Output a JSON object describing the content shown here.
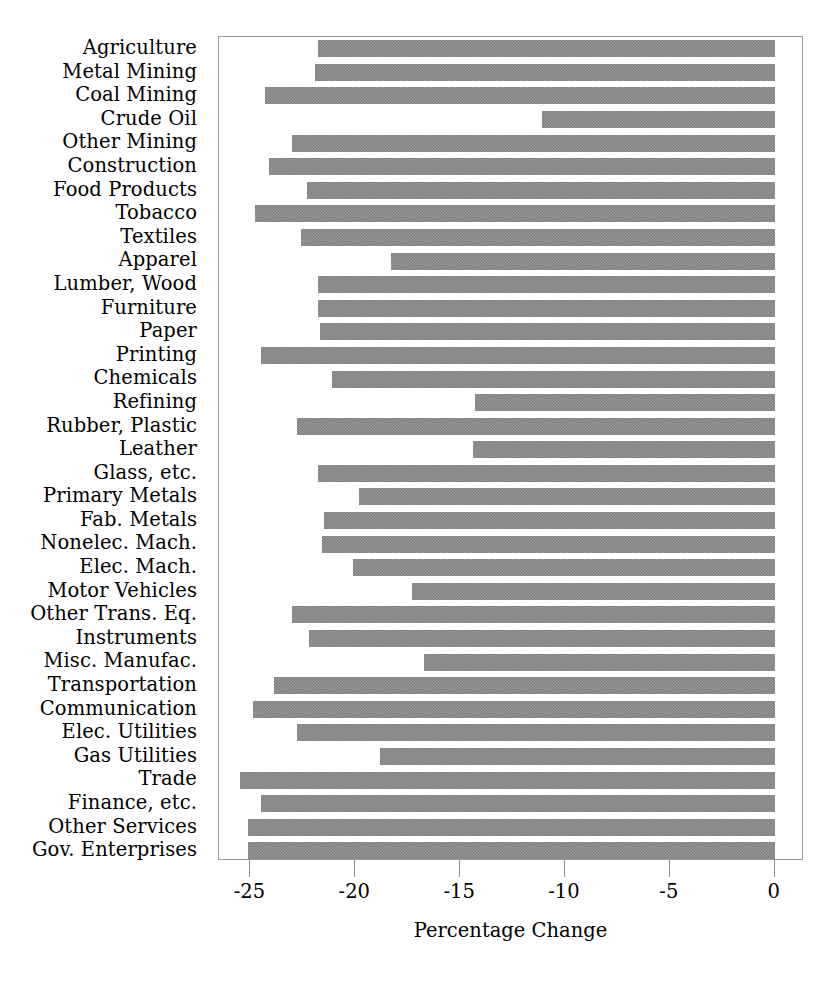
{
  "chart_data": {
    "type": "bar",
    "orientation": "horizontal",
    "title": "",
    "xlabel": "Percentage Change",
    "ylabel": "",
    "xlim": [
      -26.5,
      1.4
    ],
    "xticks": [
      -25,
      -20,
      -15,
      -10,
      -5,
      0
    ],
    "xtick_labels": [
      "-25",
      "-20",
      "-15",
      "-10",
      "-5",
      "0"
    ],
    "grid": false,
    "legend": null,
    "bar_color": "#808080",
    "categories": [
      "Agriculture",
      "Metal Mining",
      "Coal Mining",
      "Crude Oil",
      "Other Mining",
      "Construction",
      "Food Products",
      "Tobacco",
      "Textiles",
      "Apparel",
      "Lumber, Wood",
      "Furniture",
      "Paper",
      "Printing",
      "Chemicals",
      "Refining",
      "Rubber, Plastic",
      "Leather",
      "Glass, etc.",
      "Primary Metals",
      "Fab. Metals",
      "Nonelec. Mach.",
      "Elec. Mach.",
      "Motor Vehicles",
      "Other Trans. Eq.",
      "Instruments",
      "Misc. Manufac.",
      "Transportation",
      "Communication",
      "Elec. Utilities",
      "Gas Utilities",
      "Trade",
      "Finance, etc.",
      "Other Services",
      "Gov. Enterprises"
    ],
    "values": [
      -21.8,
      -21.9,
      -24.3,
      -11.1,
      -23.0,
      -24.1,
      -22.3,
      -24.8,
      -22.6,
      -18.3,
      -21.8,
      -21.8,
      -21.7,
      -24.5,
      -21.1,
      -14.3,
      -22.8,
      -14.4,
      -21.8,
      -19.8,
      -21.5,
      -21.6,
      -20.1,
      -17.3,
      -23.0,
      -22.2,
      -16.7,
      -23.9,
      -24.9,
      -22.8,
      -18.8,
      -25.5,
      -24.5,
      -25.1,
      -25.1
    ]
  }
}
